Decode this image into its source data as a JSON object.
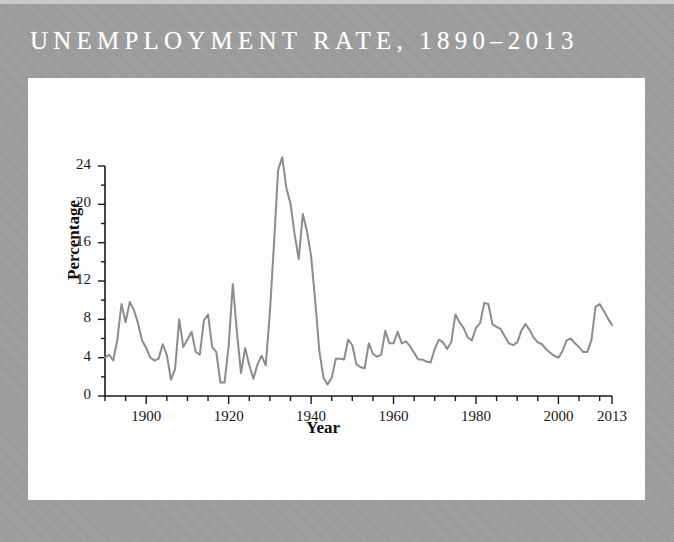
{
  "figure": {
    "title": "UNEMPLOYMENT RATE, 1890–2013",
    "frame_color": "#9d9d9d",
    "panel_color": "#fdfdfd",
    "title_color": "#ffffff"
  },
  "chart_data": {
    "type": "line",
    "title": "UNEMPLOYMENT RATE, 1890–2013",
    "xlabel": "Year",
    "ylabel": "Percentage",
    "xlim": [
      1890,
      2013
    ],
    "ylim": [
      0,
      24
    ],
    "grid": false,
    "legend": null,
    "line_color": "#8c8c8c",
    "line_width": 2,
    "yticks": [
      0,
      4,
      8,
      12,
      16,
      20,
      24
    ],
    "ytick_labels": [
      "0",
      "4",
      "8",
      "12",
      "16",
      "20",
      "24"
    ],
    "yminor_step": 2,
    "xticks": [
      1900,
      1920,
      1940,
      1960,
      1980,
      2000,
      2013
    ],
    "xtick_labels": [
      "1900",
      "1920",
      "1940",
      "1960",
      "1980",
      "2000",
      "2013"
    ],
    "xminor_step": 5,
    "x": [
      1890,
      1891,
      1892,
      1893,
      1894,
      1895,
      1896,
      1897,
      1898,
      1899,
      1900,
      1901,
      1902,
      1903,
      1904,
      1905,
      1906,
      1907,
      1908,
      1909,
      1910,
      1911,
      1912,
      1913,
      1914,
      1915,
      1916,
      1917,
      1918,
      1919,
      1920,
      1921,
      1922,
      1923,
      1924,
      1925,
      1926,
      1927,
      1928,
      1929,
      1930,
      1931,
      1932,
      1933,
      1934,
      1935,
      1936,
      1937,
      1938,
      1939,
      1940,
      1941,
      1942,
      1943,
      1944,
      1945,
      1946,
      1947,
      1948,
      1949,
      1950,
      1951,
      1952,
      1953,
      1954,
      1955,
      1956,
      1957,
      1958,
      1959,
      1960,
      1961,
      1962,
      1963,
      1964,
      1965,
      1966,
      1967,
      1968,
      1969,
      1970,
      1971,
      1972,
      1973,
      1974,
      1975,
      1976,
      1977,
      1978,
      1979,
      1980,
      1981,
      1982,
      1983,
      1984,
      1985,
      1986,
      1987,
      1988,
      1989,
      1990,
      1991,
      1992,
      1993,
      1994,
      1995,
      1996,
      1997,
      1998,
      1999,
      2000,
      2001,
      2002,
      2003,
      2004,
      2005,
      2006,
      2007,
      2008,
      2009,
      2010,
      2011,
      2012,
      2013
    ],
    "values": [
      4.0,
      4.3,
      3.7,
      5.9,
      9.6,
      7.7,
      9.8,
      9.0,
      7.6,
      5.8,
      5.0,
      4.0,
      3.7,
      3.9,
      5.4,
      4.3,
      1.7,
      2.8,
      8.0,
      5.1,
      5.9,
      6.7,
      4.6,
      4.3,
      7.9,
      8.5,
      5.1,
      4.6,
      1.4,
      1.4,
      5.2,
      11.7,
      6.7,
      2.4,
      5.0,
      3.2,
      1.8,
      3.3,
      4.2,
      3.2,
      8.7,
      15.9,
      23.6,
      24.9,
      21.7,
      20.1,
      16.9,
      14.3,
      19.0,
      17.2,
      14.6,
      9.9,
      4.7,
      1.9,
      1.2,
      1.9,
      3.9,
      3.9,
      3.8,
      5.9,
      5.3,
      3.3,
      3.0,
      2.9,
      5.5,
      4.4,
      4.1,
      4.3,
      6.8,
      5.5,
      5.5,
      6.7,
      5.5,
      5.7,
      5.2,
      4.5,
      3.8,
      3.8,
      3.6,
      3.5,
      4.9,
      5.9,
      5.6,
      4.9,
      5.6,
      8.5,
      7.7,
      7.1,
      6.1,
      5.8,
      7.1,
      7.6,
      9.7,
      9.6,
      7.5,
      7.2,
      7.0,
      6.2,
      5.5,
      5.3,
      5.6,
      6.8,
      7.5,
      6.9,
      6.1,
      5.6,
      5.4,
      4.9,
      4.5,
      4.2,
      4.0,
      4.7,
      5.8,
      6.0,
      5.5,
      5.1,
      4.6,
      4.6,
      5.8,
      9.3,
      9.6,
      8.9,
      8.1,
      7.4
    ]
  }
}
